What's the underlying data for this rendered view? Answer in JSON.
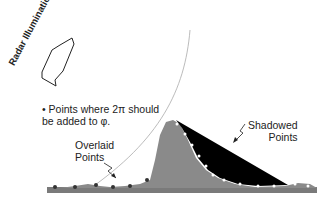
{
  "labels": {
    "radar_illumination": "Radar Illumination",
    "note_line1": "• Points where 2π should",
    "note_line2": "be added to φ.",
    "overlaid_line1": "Overlaid",
    "overlaid_line2": "Points",
    "shadowed_line1": "Shadowed",
    "shadowed_line2": "Points"
  },
  "colors": {
    "terrain": "#8a8a8a",
    "shadow": "#000000",
    "ground": "#7a7a7a",
    "arc": "#aaaaaa",
    "points_dark": "#333333",
    "points_light": "#ffffff"
  }
}
